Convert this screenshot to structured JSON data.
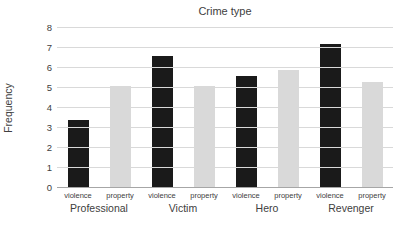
{
  "chart_data": {
    "type": "bar",
    "title": "Crime type",
    "xlabel": "",
    "ylabel": "Frequency",
    "ylim": [
      0,
      8
    ],
    "ytick_step": 1,
    "ytick_labels": [
      "0",
      "1",
      "2",
      "3",
      "4",
      "5",
      "6",
      "7",
      "8"
    ],
    "grid": true,
    "legend": "none",
    "groups": [
      "Professional",
      "Victim",
      "Hero",
      "Revenger"
    ],
    "sub_categories": [
      "violence",
      "property"
    ],
    "series": [
      {
        "name": "violence",
        "color": "#1a1a1a",
        "values": [
          3.4,
          6.6,
          5.6,
          7.2
        ]
      },
      {
        "name": "property",
        "color": "#d9d9d9",
        "values": [
          5.1,
          5.1,
          5.9,
          5.3
        ]
      }
    ],
    "colors": {
      "gridline": "#d9d9d9",
      "axis_line": "#a6a6a6",
      "text": "#404040",
      "background": "#ffffff"
    }
  }
}
